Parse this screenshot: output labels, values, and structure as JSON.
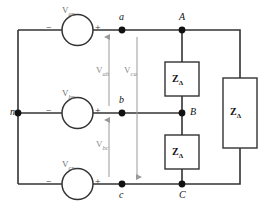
{
  "diagram": {
    "colors": {
      "wire": "#333333",
      "node": "#111111",
      "arrow": "#9a9a9a",
      "source_label": "#6f6f6f",
      "box_fill": "#ffffff",
      "background": "#ffffff"
    }
  },
  "sources": [
    {
      "id": "van",
      "name": "V",
      "sub": "an",
      "minus": "−",
      "plus": "+"
    },
    {
      "id": "vbn",
      "name": "V",
      "sub": "bn",
      "minus": "−",
      "plus": "+"
    },
    {
      "id": "vcn",
      "name": "V",
      "sub": "cn",
      "minus": "−",
      "plus": "+"
    }
  ],
  "nodes": [
    {
      "id": "n",
      "label": "n"
    },
    {
      "id": "a",
      "label": "a"
    },
    {
      "id": "b",
      "label": "b"
    },
    {
      "id": "c",
      "label": "c"
    },
    {
      "id": "A",
      "label": "A"
    },
    {
      "id": "B",
      "label": "B"
    },
    {
      "id": "C",
      "label": "C"
    }
  ],
  "voltage_arrows": [
    {
      "id": "vab",
      "name": "V",
      "sub": "ab",
      "direction": "up"
    },
    {
      "id": "vbc",
      "name": "V",
      "sub": "bc",
      "direction": "up"
    },
    {
      "id": "vca",
      "name": "V",
      "sub": "ca",
      "direction": "down"
    }
  ],
  "loads": [
    {
      "id": "z-ab",
      "name": "Z",
      "sub": "Δ"
    },
    {
      "id": "z-bc",
      "name": "Z",
      "sub": "Δ"
    },
    {
      "id": "z-ca",
      "name": "Z",
      "sub": "Δ"
    }
  ]
}
